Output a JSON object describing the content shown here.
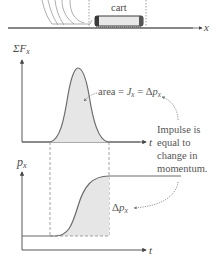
{
  "figure": {
    "top_scene": {
      "cart_label": "cart",
      "x_axis_label": "x"
    },
    "force_graph": {
      "y_axis_label_sigma": "ΣF",
      "y_axis_label_sub": "x",
      "x_axis_label": "t",
      "annotation_area": "area = ",
      "annotation_J": "J",
      "annotation_J_sub": "x",
      "annotation_eq": " = Δ",
      "annotation_p": "p",
      "annotation_p_sub": "x"
    },
    "momentum_graph": {
      "y_axis_label": "p",
      "y_axis_label_sub": "x",
      "x_axis_label": "t",
      "delta_label": "Δ",
      "delta_p": "p",
      "delta_sub": "x"
    },
    "callout": {
      "line1": "Impulse is",
      "line2": "equal to",
      "line3": "change in",
      "line4": "momentum."
    },
    "colors": {
      "axis": "#555555",
      "curve": "#6b6b6b",
      "shade": "#e6e6e6",
      "dashed": "#8a8a8a",
      "cart_body": "#e8e8e8",
      "cart_dark": "#3a3a3a"
    }
  }
}
